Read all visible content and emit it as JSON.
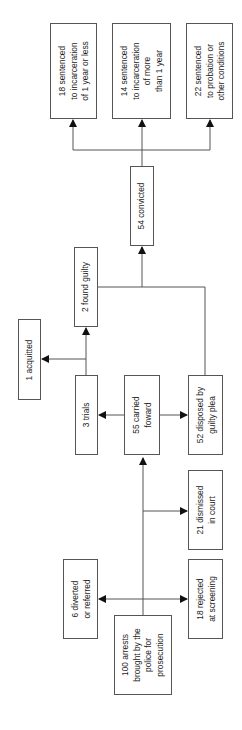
{
  "diagram": {
    "type": "flowchart",
    "orientation": "rotated-90-ccw",
    "colors": {
      "line": "#555555",
      "text": "#1a1a1a",
      "background": "#ffffff"
    },
    "nodes": {
      "arrests": {
        "label": "100 arrests\nbrought by the\npolice for\nprosecution"
      },
      "diverted": {
        "label": "6 diverted\nor referred"
      },
      "rejected": {
        "label": "18 rejected\nat screening"
      },
      "dismissed": {
        "label": "21 dismissed\nin court"
      },
      "carried": {
        "label": "55 carried\nfoward"
      },
      "trials": {
        "label": "3 trials"
      },
      "guilty_plea": {
        "label": "52 disposed by\nguilty plea"
      },
      "acquitted": {
        "label": "1 acquitted"
      },
      "found_guilty": {
        "label": "2 found guilty"
      },
      "convicted": {
        "label": "54 convicted"
      },
      "sent_short": {
        "label": "18 sentenced\nto incarceration\nof 1 year or less"
      },
      "sent_long": {
        "label": "14 sentenced\nto incarceration\nof more\nthan 1 year"
      },
      "sent_probation": {
        "label": "22 sentenced\nto probation or\nother conditions"
      }
    },
    "edges": [
      [
        "arrests",
        "diverted"
      ],
      [
        "arrests",
        "rejected"
      ],
      [
        "arrests",
        "dismissed"
      ],
      [
        "arrests",
        "carried"
      ],
      [
        "carried",
        "trials"
      ],
      [
        "carried",
        "guilty_plea"
      ],
      [
        "trials",
        "acquitted"
      ],
      [
        "trials",
        "found_guilty"
      ],
      [
        "found_guilty",
        "convicted"
      ],
      [
        "guilty_plea",
        "convicted"
      ],
      [
        "convicted",
        "sent_short"
      ],
      [
        "convicted",
        "sent_long"
      ],
      [
        "convicted",
        "sent_probation"
      ]
    ]
  }
}
